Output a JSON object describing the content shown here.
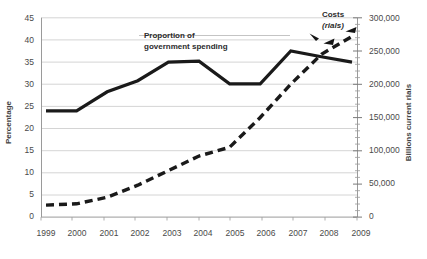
{
  "chart_data": {
    "type": "line",
    "title": "",
    "xlabel": "",
    "categories": [
      "1999",
      "2000",
      "2001",
      "2002",
      "2003",
      "2004",
      "2005",
      "2006",
      "2007",
      "2008",
      "2009"
    ],
    "grid": true,
    "legend_position": "inline-annotations",
    "axes": {
      "left": {
        "label": "Percentage",
        "min": 0,
        "max": 45,
        "step": 5,
        "ticks": [
          "0",
          "5",
          "10",
          "15",
          "20",
          "25",
          "30",
          "35",
          "40",
          "45"
        ]
      },
      "right": {
        "label": "Billions current rials",
        "min": 0,
        "max": 300000,
        "step": 50000,
        "minor_step": 10000,
        "ticks": [
          "0",
          "50,000",
          "100,000",
          "150,000",
          "200,000",
          "250,000",
          "300,000"
        ]
      }
    },
    "series": [
      {
        "name": "Proportion of government spending",
        "axis": "left",
        "style": "solid",
        "color": "#1a1a1a",
        "values": [
          24.0,
          24.0,
          28.3,
          30.8,
          35.0,
          35.2,
          30.1,
          30.1,
          37.5,
          36.2,
          35.0
        ]
      },
      {
        "name": "Costs (rials)",
        "axis": "right",
        "style": "dashed",
        "color": "#1a1a1a",
        "values": [
          18000,
          20000,
          30000,
          48000,
          70000,
          92000,
          105000,
          150000,
          200000,
          245000,
          272000
        ]
      }
    ],
    "annotations": [
      {
        "name": "proportion-annotation",
        "line1": "Proportion of",
        "line2": "government spending"
      },
      {
        "name": "costs-annotation",
        "line1": "Costs",
        "line2": "(rials)"
      }
    ],
    "colors": {
      "line": "#1a1a1a",
      "grid": "#c9c9c9",
      "axis": "#808080",
      "text": "#4a4a4a"
    }
  }
}
